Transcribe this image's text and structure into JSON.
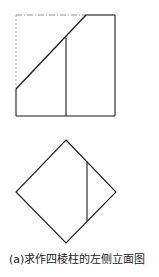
{
  "figure": {
    "caption": "(a)求作四棱柱的左侧立面图",
    "line_color": "#1a1a1a",
    "elevation_view": {
      "description": "square elevation with cut diagonal plane",
      "square": {
        "x1": 16,
        "y1": 15,
        "x2": 115,
        "y2": 116
      },
      "diagonal": {
        "from": [
          16,
          89
        ],
        "to": [
          86,
          15
        ]
      },
      "vertical_edge": {
        "x": 66,
        "y_top": 38,
        "y_bottom": 116
      },
      "hidden_segments": [
        "top edge left portion (dash-dot)",
        "left edge upper portion (dashed)"
      ]
    },
    "plan_view": {
      "description": "diamond (rotated square) plan view",
      "vertices": {
        "top": [
          66,
          140
        ],
        "right": [
          116,
          192
        ],
        "bottom": [
          66,
          243
        ],
        "left": [
          16,
          192
        ]
      },
      "vertical_edge": {
        "x": 87,
        "y_top": 162,
        "y_bottom": 221
      }
    }
  }
}
